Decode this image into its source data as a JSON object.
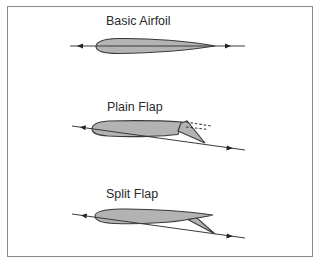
{
  "figure": {
    "panels": [
      {
        "id": "basic",
        "label": "Basic Airfoil"
      },
      {
        "id": "plain",
        "label": "Plain Flap"
      },
      {
        "id": "split",
        "label": "Split Flap"
      }
    ]
  },
  "colors": {
    "airfoil_fill": "#b3b3b3",
    "outline": "#3a3a3a",
    "chord_line": "#3a3a3a",
    "frame": "#8a8a8a",
    "text": "#2a2a2a"
  }
}
